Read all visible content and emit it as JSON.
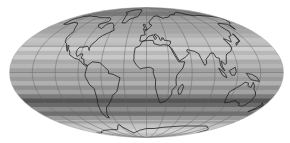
{
  "map": {
    "projection": "Mollweide",
    "description": "Global map with zonal grayscale latitude bands, coastlines and graticule",
    "graticule": {
      "meridian_step_deg": 30,
      "parallel_step_deg": 30
    },
    "band_colors_north_to_south": [
      "#8a8a8a",
      "#7a7a7a",
      "#9a9a9a",
      "#a8a8a8",
      "#a0a0a0",
      "#a5a5a5",
      "#b2b2b2",
      "#c2c2c2",
      "#bdbdbd",
      "#cfcfcf",
      "#b8b8b8",
      "#c8c8c8",
      "#aaaaaa",
      "#b5b5b5",
      "#9f9f9f",
      "#a9a9a9",
      "#9a9a9a",
      "#b0b0b0",
      "#8f8f8f",
      "#a3a3a3",
      "#7b7b7b",
      "#555555",
      "#6a6a6a",
      "#8c8c8c",
      "#6f6f6f",
      "#9a9a9a",
      "#b4b4b4",
      "#c5c5c5",
      "#d0d0d0",
      "#c0c0c0"
    ],
    "colors": {
      "coastline": "#222222",
      "graticule": "#6b6b6b",
      "background": "#ffffff"
    }
  }
}
